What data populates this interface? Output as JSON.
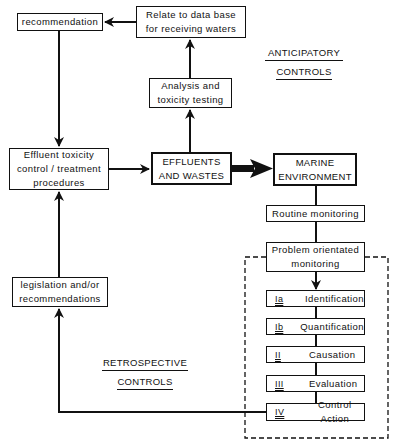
{
  "boxes": {
    "recommendation": "recommendation",
    "relate_line1": "Relate to data base",
    "relate_line2": "for receiving waters",
    "analysis_line1": "Analysis and",
    "analysis_line2": "toxicity testing",
    "effluent_control_line1": "Effluent toxicity",
    "effluent_control_line2": "control / treatment",
    "effluent_control_line3": "procedures",
    "effluents_line1": "EFFLUENTS",
    "effluents_line2": "AND WASTES",
    "marine_line1": "MARINE",
    "marine_line2": "ENVIRONMENT",
    "routine": "Routine monitoring",
    "problem_line1": "Problem orientated",
    "problem_line2": "monitoring",
    "legislation_line1": "legislation and/or",
    "legislation_line2": "recommendations"
  },
  "steps": [
    {
      "num": "Ia",
      "label": "Identification"
    },
    {
      "num": "Ib",
      "label": "Quantification"
    },
    {
      "num": "II",
      "label": "Causation"
    },
    {
      "num": "III",
      "label": "Evaluation"
    },
    {
      "num": "IV",
      "label": "Control Action"
    }
  ],
  "headings": {
    "anticipatory_line1": "ANTICIPATORY",
    "anticipatory_line2": "CONTROLS",
    "retrospective_line1": "RETROSPECTIVE",
    "retrospective_line2": "CONTROLS"
  },
  "colors": {
    "line": "#111111",
    "background": "#ffffff"
  }
}
